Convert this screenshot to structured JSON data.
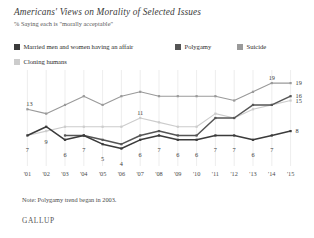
{
  "header": {
    "title": "Americans' Views on Morality of Selected Issues",
    "subtitle": "% Saying each is \"morally acceptable\""
  },
  "legend": {
    "items": [
      {
        "label": "Married men and women having an affair",
        "color": "#3b3b3b",
        "key": "affair"
      },
      {
        "label": "Polygamy",
        "color": "#555555",
        "key": "polygamy"
      },
      {
        "label": "Suicide",
        "color": "#9a9a9a",
        "key": "suicide"
      },
      {
        "label": "Cloning humans",
        "color": "#cccccc",
        "key": "cloning"
      }
    ]
  },
  "note": "Note: Polygamy trend began in 2003.",
  "brand": "GALLUP",
  "chart_data": {
    "type": "line",
    "title": "Americans' Views on Morality of Selected Issues",
    "subtitle": "% Saying each is \"morally acceptable\"",
    "xlabel": "",
    "ylabel": "",
    "ylim": [
      0,
      22
    ],
    "grid": "vertical",
    "legend_position": "top",
    "x": [
      "2001",
      "2002",
      "2003",
      "2004",
      "2005",
      "2006",
      "2007",
      "2008",
      "2009",
      "2010",
      "2011",
      "2012",
      "2013",
      "2014",
      "2015"
    ],
    "tick_labels": [
      "'01",
      "'02",
      "'03",
      "'04",
      "'05",
      "'06",
      "'07",
      "'08",
      "'09",
      "'10",
      "'11",
      "'12",
      "'13",
      "'14",
      "'15"
    ],
    "series": [
      {
        "name": "Married men and women having an affair",
        "color": "#3b3b3b",
        "values": [
          7,
          9,
          6,
          7,
          5,
          4,
          6,
          7,
          6,
          6,
          7,
          7,
          6,
          7,
          8
        ],
        "labels": [
          "7",
          "9",
          "6",
          "7",
          "5",
          "4",
          "6",
          "7",
          "6",
          "6",
          "7",
          "7",
          "6",
          "7",
          "8"
        ]
      },
      {
        "name": "Polygamy",
        "color": "#555555",
        "values": [
          null,
          null,
          7,
          7,
          6,
          5,
          7,
          8,
          7,
          7,
          11,
          11,
          14,
          14,
          16
        ],
        "labels": [
          null,
          null,
          null,
          null,
          null,
          null,
          null,
          null,
          null,
          null,
          null,
          null,
          null,
          null,
          "16"
        ]
      },
      {
        "name": "Suicide",
        "color": "#9a9a9a",
        "values": [
          13,
          12,
          14,
          16,
          14,
          16,
          17,
          16,
          16,
          16,
          16,
          15,
          17,
          19,
          19
        ],
        "labels": [
          "13",
          null,
          null,
          null,
          null,
          null,
          null,
          null,
          null,
          null,
          null,
          null,
          null,
          "19",
          "19"
        ]
      },
      {
        "name": "Cloning humans",
        "color": "#cccccc",
        "values": [
          7,
          8,
          9,
          9,
          9,
          9,
          11,
          10,
          9,
          9,
          12,
          11,
          13,
          14,
          15
        ],
        "labels": [
          null,
          null,
          null,
          null,
          null,
          null,
          "11",
          null,
          null,
          null,
          null,
          null,
          null,
          null,
          "15"
        ]
      }
    ],
    "end_labels": [
      {
        "series": "Suicide",
        "value": 19
      },
      {
        "series": "Polygamy",
        "value": 16
      },
      {
        "series": "Cloning humans",
        "value": 15
      },
      {
        "series": "Married men and women having an affair",
        "value": 8
      }
    ]
  }
}
